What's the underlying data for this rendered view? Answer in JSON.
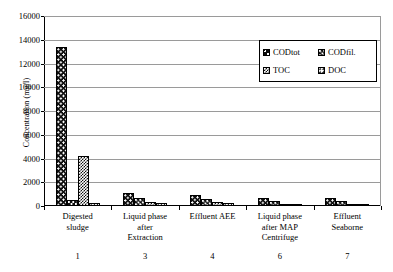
{
  "chart_data": {
    "type": "bar",
    "title": "",
    "xlabel": "",
    "ylabel": "Concentration (mg/l)",
    "ylim": [
      0,
      16000
    ],
    "ytick_labels": [
      "0",
      "2000",
      "4000",
      "6000",
      "8000",
      "10000",
      "12000",
      "14000",
      "16000"
    ],
    "yticks": [
      0,
      2000,
      4000,
      6000,
      8000,
      10000,
      12000,
      14000,
      16000
    ],
    "grid": true,
    "legend_position": "top-right",
    "categories": [
      "Digested sludge",
      "Liquid phase after Extraction",
      "Effluent AEE",
      "Liquid phase after MAP Centrifuge",
      "Effluent Seaborne"
    ],
    "category_lines": [
      [
        "Digested",
        "sludge"
      ],
      [
        "Liquid phase",
        "after",
        "Extraction"
      ],
      [
        "Effluent AEE"
      ],
      [
        "Liquid phase",
        "after MAP",
        "Centrifuge"
      ],
      [
        "Effluent",
        "Seaborne"
      ]
    ],
    "category_numbers": [
      "1",
      "3",
      "4",
      "6",
      "7"
    ],
    "series": [
      {
        "name": "CODtot",
        "pattern": "black-white-dots",
        "values": [
          13400,
          1100,
          950,
          700,
          700
        ]
      },
      {
        "name": "CODfil.",
        "pattern": "black-large-dots",
        "values": [
          500,
          700,
          600,
          420,
          430
        ]
      },
      {
        "name": "TOC",
        "pattern": "checkerboard",
        "values": [
          4200,
          350,
          300,
          200,
          190
        ]
      },
      {
        "name": "DOC",
        "pattern": "white-black-dots",
        "values": [
          250,
          250,
          230,
          170,
          160
        ]
      }
    ]
  },
  "colors": {
    "axis": "#000000",
    "gridline": "#9a9a9a",
    "background": "#ffffff",
    "bar_outline": "#000000"
  }
}
